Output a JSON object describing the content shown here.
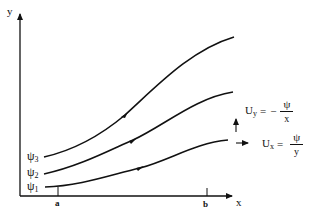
{
  "diagram": {
    "type": "streamline-diagram",
    "axes": {
      "x_label": "x",
      "y_label": "y",
      "ticks": [
        {
          "label": "a",
          "position": "left-bound"
        },
        {
          "label": "b",
          "position": "right-bound"
        }
      ]
    },
    "streamlines": [
      {
        "label_base": "ψ",
        "label_sub": "1",
        "direction": "left-to-right"
      },
      {
        "label_base": "ψ",
        "label_sub": "2",
        "direction": "left-to-right"
      },
      {
        "label_base": "ψ",
        "label_sub": "3",
        "direction": "left-to-right"
      }
    ],
    "equations": {
      "uy": {
        "lhs_base": "U",
        "lhs_sub": "y",
        "equals": "=",
        "sign": "−",
        "numerator": "ψ",
        "denominator": "x"
      },
      "ux": {
        "lhs_base": "U",
        "lhs_sub": "x",
        "equals": "=",
        "sign": "",
        "numerator": "ψ",
        "denominator": "y"
      }
    },
    "velocity_arrows": [
      "up",
      "right"
    ],
    "colors": {
      "ink": "#111111",
      "background": "#ffffff"
    }
  }
}
